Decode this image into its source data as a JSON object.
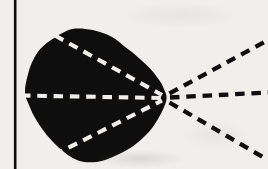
{
  "figure": {
    "width": 268,
    "height": 169,
    "paper_color": "#f1efec",
    "ink_color": "#0e0e0e",
    "frame_line": {
      "x": 15.2,
      "stroke_width": 2.6
    },
    "eye": {
      "outline_path": "M 72,29 C 82,27.5 96,30 107,34.5 C 112,36.5 116.5,39.5 121,43.5 C 126,48 131,51 136,55.5 C 143,62 149,66.5 154,73 C 158,78.5 161.5,82.5 163.5,88 C 165.3,92 166.6,94.8 166.6,97.8 C 166.6,102.3 164,107.5 161.8,112 C 159,117.5 156,122.8 152.5,127.5 C 148,133.5 142,139 136.5,143.5 C 130.5,148.4 123.5,152.3 116.5,155.2 C 110,158 103.5,161.2 96.5,162 C 90,162.8 83.5,162.3 77.5,160.2 C 71,157.9 65,153 59.5,148.2 C 53.3,142.8 47.8,136.8 43,130 C 37.8,122.7 32.7,115.2 29.8,107 C 27.5,100.5 25.3,98 25,93 C 24.6,86.2 26.6,79.5 28.3,73 C 30.2,65.7 33.3,58.5 37.5,52.5 C 41,47.5 44.8,44.5 49.5,41 C 53.5,38 57.5,35.5 62,33.2 C 65.2,31.6 68.5,29.6 72,29 Z"
    },
    "focal_point": {
      "x": 163,
      "y": 98
    },
    "dash_pattern": {
      "dash": 9.5,
      "gap": 6.8,
      "thickness": 4.1
    },
    "rays_inside_eye": [
      {
        "name": "upper-retinal-ray",
        "x1": 55,
        "y1": 35.5,
        "x2": 162,
        "y2": 95
      },
      {
        "name": "axial-retinal-ray",
        "x1": 21,
        "y1": 95.5,
        "x2": 162,
        "y2": 98
      },
      {
        "name": "lower-retinal-ray",
        "x1": 54,
        "y1": 155,
        "x2": 162,
        "y2": 100.5
      }
    ],
    "rays_outside_eye": [
      {
        "name": "upper-light-ray",
        "x1": 169.5,
        "y1": 93.5,
        "x2": 268,
        "y2": 40
      },
      {
        "name": "axial-light-ray",
        "x1": 170,
        "y1": 97.5,
        "x2": 268,
        "y2": 92.5
      },
      {
        "name": "lower-light-ray",
        "x1": 169.5,
        "y1": 102.5,
        "x2": 268,
        "y2": 160
      }
    ]
  }
}
